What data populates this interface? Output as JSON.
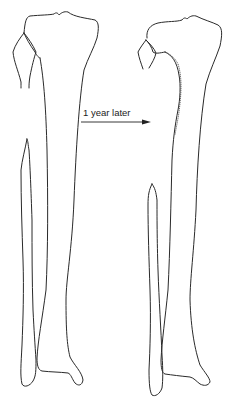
{
  "diagram": {
    "annotation": {
      "label": "1 year later",
      "arrow_direction": "right"
    },
    "panels": [
      {
        "name": "before",
        "position": "left"
      },
      {
        "name": "after",
        "position": "right"
      }
    ],
    "colors": {
      "line": "#2a2a2a",
      "background": "#ffffff"
    }
  }
}
